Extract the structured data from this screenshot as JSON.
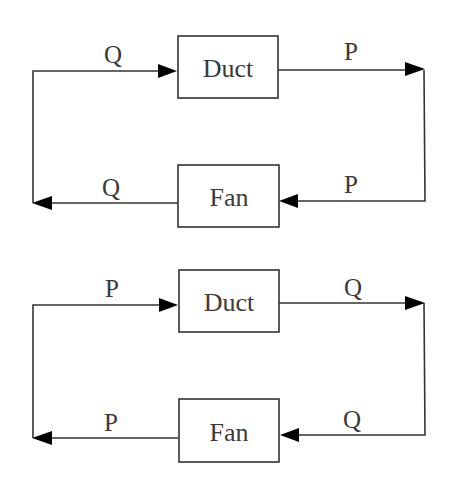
{
  "diagrams": [
    {
      "name": "impedance-loop",
      "top_block": {
        "label": "Duct"
      },
      "bottom_block": {
        "label": "Fan"
      },
      "signals": {
        "top_left": "Q",
        "top_right": "P",
        "bottom_right": "P",
        "bottom_left": "Q"
      }
    },
    {
      "name": "admittance-loop",
      "top_block": {
        "label": "Duct"
      },
      "bottom_block": {
        "label": "Fan"
      },
      "signals": {
        "top_left": "P",
        "top_right": "Q",
        "bottom_right": "Q",
        "bottom_left": "P"
      }
    }
  ],
  "colors": {
    "line": "#333333",
    "arrowhead": "#000000",
    "text": "#3a3a3a",
    "background": "#ffffff"
  }
}
